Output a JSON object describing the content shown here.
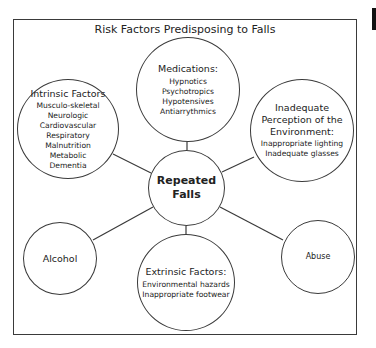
{
  "diagram": {
    "title": "Risk Factors Predisposing to Falls",
    "center": {
      "label_line1": "Repeated",
      "label_line2": "Falls"
    },
    "nodes": {
      "medications": {
        "heading": "Medications:",
        "items": [
          "Hypnotics",
          "Psychotropics",
          "Hypotensives",
          "Antiarrythmics"
        ]
      },
      "intrinsic": {
        "heading": "Intrinsic Factors",
        "items": [
          "Musculo-skeletal",
          "Neurologic",
          "Cardiovascular",
          "Respiratory",
          "Malnutrition",
          "Metabolic",
          "Dementia"
        ]
      },
      "perception": {
        "heading_line1": "Inadequate",
        "heading_line2": "Perception of the",
        "heading_line3": "Environment:",
        "items": [
          "Inappropriate lighting",
          "Inadequate glasses"
        ]
      },
      "alcohol": {
        "heading": "Alcohol"
      },
      "extrinsic": {
        "heading": "Extrinsic Factors:",
        "items": [
          "Environmental hazards",
          "Inappropriate footwear"
        ]
      },
      "abuse": {
        "heading": "Abuse"
      }
    },
    "colors": {
      "stroke": "#3a3a3a",
      "text": "#222222",
      "background": "#ffffff"
    }
  }
}
